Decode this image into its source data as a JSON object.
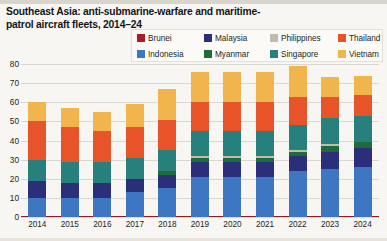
{
  "title": "Southeast Asia: anti-submarine-warfare and maritime-patrol aircraft fleets, 2014–24",
  "legend": {
    "position": "top-right",
    "entries": [
      {
        "label": "Brunei",
        "color": "#a81f23"
      },
      {
        "label": "Indonesia",
        "color": "#3d77c2"
      },
      {
        "label": "Malaysia",
        "color": "#2b2f7a"
      },
      {
        "label": "Myanmar",
        "color": "#1f6b3a"
      },
      {
        "label": "Philippines",
        "color": "#bfbbae"
      },
      {
        "label": "Singapore",
        "color": "#27807c"
      },
      {
        "label": "Thailand",
        "color": "#e8542a"
      },
      {
        "label": "Vietnam",
        "color": "#f2b54e"
      }
    ]
  },
  "chart_data": {
    "type": "bar",
    "stacked": true,
    "title": "Southeast Asia: anti-submarine-warfare and maritime-patrol aircraft fleets, 2014–24",
    "xlabel": "",
    "ylabel": "",
    "ylim": [
      0,
      80
    ],
    "yticks": [
      0,
      10,
      20,
      30,
      40,
      50,
      60,
      70,
      80
    ],
    "grid": true,
    "categories": [
      "2014",
      "2015",
      "2016",
      "2017",
      "2018",
      "2019",
      "2020",
      "2021",
      "2022",
      "2023",
      "2024"
    ],
    "series": [
      {
        "name": "Brunei",
        "color": "#a81f23",
        "values": [
          0,
          0,
          0,
          0,
          0,
          0,
          0,
          0,
          0,
          0,
          0
        ]
      },
      {
        "name": "Indonesia",
        "color": "#3d77c2",
        "values": [
          10,
          10,
          10,
          13,
          15,
          21,
          21,
          21,
          24,
          25,
          26
        ]
      },
      {
        "name": "Malaysia",
        "color": "#2b2f7a",
        "values": [
          9,
          8,
          8,
          7,
          7,
          8,
          8,
          8,
          8,
          9,
          10
        ]
      },
      {
        "name": "Myanmar",
        "color": "#1f6b3a",
        "values": [
          0,
          0,
          0,
          0,
          2,
          2,
          2,
          2,
          2,
          3,
          3
        ]
      },
      {
        "name": "Philippines",
        "color": "#bfbbae",
        "values": [
          0,
          0,
          0,
          0,
          0,
          1,
          1,
          1,
          1,
          1,
          0
        ]
      },
      {
        "name": "Singapore",
        "color": "#27807c",
        "values": [
          11,
          11,
          11,
          11,
          11,
          13,
          13,
          13,
          13,
          14,
          14
        ]
      },
      {
        "name": "Thailand",
        "color": "#e8542a",
        "values": [
          20,
          18,
          16,
          16,
          16,
          15,
          15,
          15,
          15,
          11,
          11
        ]
      },
      {
        "name": "Vietnam",
        "color": "#f2b54e",
        "values": [
          10,
          10,
          10,
          12,
          16,
          16,
          16,
          16,
          16,
          10,
          10
        ]
      }
    ],
    "totals": [
      60,
      57,
      55,
      59,
      67,
      76,
      76,
      76,
      79,
      73,
      74
    ]
  }
}
